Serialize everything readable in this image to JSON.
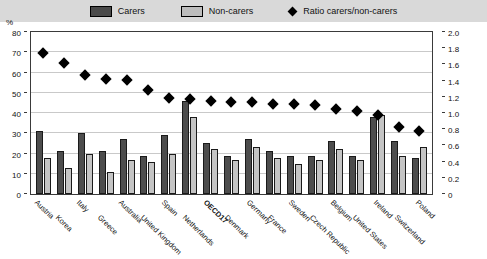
{
  "legend": {
    "items": [
      {
        "name": "carers-swatch",
        "label": "Carers"
      },
      {
        "name": "non-carers-swatch",
        "label": "Non-carers"
      },
      {
        "name": "ratio-marker",
        "label": "Ratio carers/non-carers"
      }
    ]
  },
  "axes": {
    "unit_label": "%",
    "left_ticks": [
      "80",
      "70",
      "60",
      "50",
      "40",
      "30",
      "20",
      "10",
      "0"
    ],
    "right_ticks": [
      "2.0",
      "1.8",
      "1.6",
      "1.4",
      "1.2",
      "1.0",
      "0.8",
      "0.6",
      "0.4",
      "0.2",
      "0"
    ]
  },
  "colors": {
    "carers": "#4d4d4d",
    "non_carers": "#c4c4c4",
    "marker": "#000000",
    "legend_background": "#d9d9d9",
    "grid": "#c9c9c9"
  },
  "chart_data": {
    "type": "bar",
    "title": "",
    "xlabel": "",
    "ylabel": "%",
    "ylim": [
      0,
      80
    ],
    "y2lim": [
      0,
      2.0
    ],
    "y2label": "Ratio carers/non-carers",
    "grid": true,
    "legend_position": "top",
    "categories": [
      "Austria",
      "Korea",
      "Italy",
      "Greece",
      "Australia",
      "United Kingdom",
      "Spain",
      "Netherlands",
      "OECD17",
      "Denmark",
      "Germany",
      "France",
      "Sweden",
      "Czech Republic",
      "Belgium",
      "United States",
      "Ireland",
      "Switzerland",
      "Poland"
    ],
    "highlight_category": "OECD17",
    "series": [
      {
        "name": "Carers",
        "axis": "left",
        "values": [
          31,
          21,
          30,
          21,
          27,
          19,
          29,
          46,
          25,
          19,
          27,
          21,
          19,
          19,
          26,
          19,
          38,
          26,
          18
        ]
      },
      {
        "name": "Non-carers",
        "axis": "left",
        "values": [
          18,
          13,
          20,
          11,
          17,
          16,
          20,
          38,
          22,
          17,
          23,
          18,
          15,
          17,
          22,
          17,
          39,
          19,
          23
        ]
      },
      {
        "name": "Ratio carers/non-carers",
        "axis": "right",
        "values": [
          1.74,
          1.62,
          1.47,
          1.42,
          1.41,
          1.29,
          1.18,
          1.17,
          1.15,
          1.13,
          1.13,
          1.11,
          1.11,
          1.1,
          1.05,
          1.03,
          0.97,
          0.83,
          0.78
        ]
      }
    ]
  }
}
